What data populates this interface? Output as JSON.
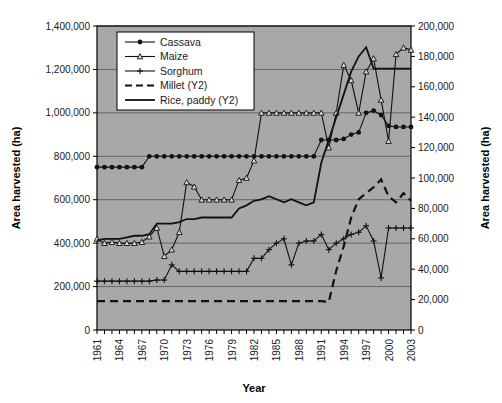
{
  "chart_data": {
    "type": "line",
    "title": "",
    "xlabel": "Year",
    "ylabel": "Area harvested (ha)",
    "y2label": "Area harvested (ha)",
    "grid": true,
    "legend_position": "top-left-inside",
    "plot_background": "#a8a8a8",
    "line_color": "#111111",
    "xlim": [
      1961,
      2003
    ],
    "ylim": [
      0,
      1400000
    ],
    "y2lim": [
      0,
      200000
    ],
    "xticks_labeled": [
      "1961",
      "1964",
      "1967",
      "1970",
      "1973",
      "1976",
      "1979",
      "1982",
      "1985",
      "1988",
      "1991",
      "1994",
      "1997",
      "2000",
      "2003"
    ],
    "xticks_label_step": 3,
    "yticks": [
      "0",
      "200,000",
      "400,000",
      "600,000",
      "800,000",
      "1,000,000",
      "1,200,000",
      "1,400,000"
    ],
    "y2ticks": [
      "0",
      "20,000",
      "40,000",
      "60,000",
      "80,000",
      "100,000",
      "120,000",
      "140,000",
      "160,000",
      "180,000",
      "200,000"
    ],
    "x": [
      1961,
      1962,
      1963,
      1964,
      1965,
      1966,
      1967,
      1968,
      1969,
      1970,
      1971,
      1972,
      1973,
      1974,
      1975,
      1976,
      1977,
      1978,
      1979,
      1980,
      1981,
      1982,
      1983,
      1984,
      1985,
      1986,
      1987,
      1988,
      1989,
      1990,
      1991,
      1992,
      1993,
      1994,
      1995,
      1996,
      1997,
      1998,
      1999,
      2000,
      2001,
      2002,
      2003
    ],
    "series": [
      {
        "name": "Cassava",
        "axis": "y1",
        "marker": "filled-circle",
        "dash": "none",
        "values": [
          750000,
          750000,
          750000,
          750000,
          750000,
          750000,
          750000,
          800000,
          800000,
          800000,
          800000,
          800000,
          800000,
          800000,
          800000,
          800000,
          800000,
          800000,
          800000,
          800000,
          800000,
          800000,
          800000,
          800000,
          800000,
          800000,
          800000,
          800000,
          800000,
          800000,
          875000,
          875000,
          875000,
          880000,
          900000,
          910000,
          1000000,
          1010000,
          990000,
          940000,
          935000,
          935000,
          935000
        ]
      },
      {
        "name": "Maize",
        "axis": "y1",
        "marker": "open-triangle",
        "dash": "none",
        "values": [
          420000,
          400000,
          405000,
          400000,
          400000,
          400000,
          405000,
          430000,
          470000,
          340000,
          370000,
          450000,
          680000,
          660000,
          600000,
          600000,
          600000,
          600000,
          600000,
          690000,
          700000,
          780000,
          1000000,
          1000000,
          1000000,
          1000000,
          1000000,
          1000000,
          1000000,
          1000000,
          1000000,
          840000,
          1000000,
          1220000,
          1150000,
          1000000,
          1190000,
          1250000,
          1060000,
          870000,
          1270000,
          1300000,
          1290000
        ]
      },
      {
        "name": "Sorghum",
        "axis": "y1",
        "marker": "plus",
        "dash": "none",
        "values": [
          225000,
          225000,
          225000,
          225000,
          225000,
          225000,
          225000,
          225000,
          230000,
          230000,
          300000,
          270000,
          270000,
          270000,
          270000,
          270000,
          270000,
          270000,
          270000,
          270000,
          270000,
          330000,
          330000,
          370000,
          400000,
          420000,
          300000,
          400000,
          410000,
          410000,
          440000,
          370000,
          400000,
          420000,
          440000,
          450000,
          480000,
          410000,
          240000,
          470000,
          470000,
          470000,
          470000
        ]
      },
      {
        "name": "Millet (Y2)",
        "axis": "y2",
        "marker": "none",
        "dash": "dashed",
        "values": [
          19000,
          19000,
          19000,
          19000,
          19000,
          19000,
          19000,
          19000,
          19000,
          19000,
          19000,
          19000,
          19000,
          19000,
          19000,
          19000,
          19000,
          19000,
          19000,
          19000,
          19000,
          19000,
          19000,
          19000,
          19000,
          19000,
          19000,
          19000,
          19000,
          19000,
          19000,
          18500,
          39000,
          55000,
          74000,
          86000,
          90000,
          94000,
          99000,
          88000,
          84000,
          90000,
          85000
        ]
      },
      {
        "name": "Rice, paddy (Y2)",
        "axis": "y2",
        "marker": "none",
        "dash": "solid",
        "values": [
          59000,
          60000,
          60000,
          60000,
          61000,
          62000,
          62000,
          63000,
          70000,
          70000,
          70000,
          71000,
          73000,
          73000,
          74000,
          74000,
          74000,
          74000,
          74000,
          80000,
          82000,
          85000,
          86000,
          88000,
          86000,
          84000,
          86000,
          84000,
          82000,
          84000,
          110000,
          125000,
          140000,
          155000,
          170000,
          180000,
          186000,
          172000,
          172000,
          172000,
          172000,
          172000,
          172000
        ]
      }
    ]
  },
  "legend": {
    "items": [
      {
        "label": "Cassava"
      },
      {
        "label": "Maize"
      },
      {
        "label": "Sorghum"
      },
      {
        "label": "Millet (Y2)"
      },
      {
        "label": "Rice, paddy (Y2)"
      }
    ]
  }
}
